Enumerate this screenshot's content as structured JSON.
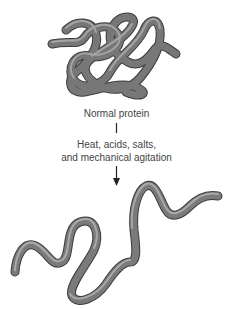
{
  "diagram": {
    "top_label": "Normal protein",
    "process_line1": "Heat, acids, salts,",
    "process_line2": "and mechanical agitation",
    "colors": {
      "strand": "#6e6e6e",
      "strand_highlight": "#a8a8a8",
      "strand_dark": "#3c3c3c",
      "text": "#444444",
      "arrow": "#222222"
    }
  }
}
